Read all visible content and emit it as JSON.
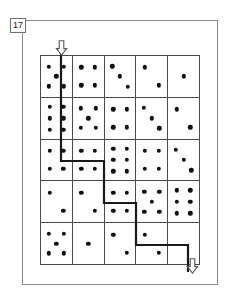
{
  "figure": {
    "problem_number": "17",
    "type": "domino-maze-path-puzzle",
    "grid": {
      "rows": 5,
      "columns": 5,
      "cell_label": "domino-cell"
    },
    "colors": {
      "pip": "#111111",
      "grid_line": "#4a4a4a",
      "frame": "#8a8a8a",
      "path": "#1a1a1a",
      "background": "#ffffff"
    },
    "cells": [
      [
        {
          "pips": 5,
          "layout": "five"
        },
        {
          "pips": 4,
          "layout": "four"
        },
        {
          "pips": 3,
          "layout": "three"
        },
        {
          "pips": 2,
          "layout": "two"
        },
        {
          "pips": 1,
          "layout": "one"
        }
      ],
      [
        {
          "pips": 6,
          "layout": "six"
        },
        {
          "pips": 5,
          "layout": "five"
        },
        {
          "pips": 4,
          "layout": "four"
        },
        {
          "pips": 3,
          "layout": "three"
        },
        {
          "pips": 2,
          "layout": "two"
        }
      ],
      [
        {
          "pips": 4,
          "layout": "four"
        },
        {
          "pips": 4,
          "layout": "four"
        },
        {
          "pips": 6,
          "layout": "six"
        },
        {
          "pips": 4,
          "layout": "four"
        },
        {
          "pips": 3,
          "layout": "three"
        }
      ],
      [
        {
          "pips": 2,
          "layout": "two"
        },
        {
          "pips": 2,
          "layout": "two"
        },
        {
          "pips": 4,
          "layout": "four"
        },
        {
          "pips": 5,
          "layout": "five"
        },
        {
          "pips": 6,
          "layout": "six"
        }
      ],
      [
        {
          "pips": 5,
          "layout": "five"
        },
        {
          "pips": 1,
          "layout": "one"
        },
        {
          "pips": 2,
          "layout": "two"
        },
        {
          "pips": 2,
          "layout": "two"
        },
        {
          "pips": 0,
          "layout": "blank"
        }
      ]
    ],
    "entry_arrow": {
      "name": "entry-arrow",
      "direction": "down",
      "position": "top-edge-column-1"
    },
    "exit_arrow": {
      "name": "exit-arrow",
      "direction": "down",
      "position": "bottom-edge-column-5"
    },
    "path": {
      "name": "solution-path",
      "stroke_width": 2.2,
      "points": "61,45 61,161 104,161 104,203 136,203 136,245 188,245 188,272"
    }
  }
}
